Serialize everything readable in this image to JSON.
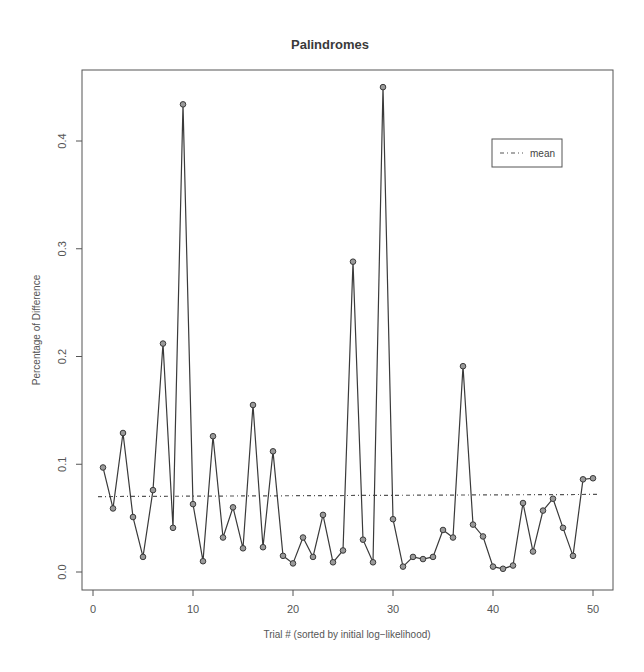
{
  "chart_data": {
    "type": "line",
    "title": "Palindromes",
    "xlabel": "Trial # (sorted by initial log−likelihood)",
    "ylabel": "Percentage of Difference",
    "xlim": [
      0,
      52
    ],
    "ylim": [
      -0.017,
      0.465
    ],
    "x_ticks": [
      0,
      10,
      20,
      30,
      40,
      50
    ],
    "y_ticks": [
      0.0,
      0.1,
      0.2,
      0.3,
      0.4
    ],
    "y_tick_labels": [
      "0.0",
      "0.1",
      "0.2",
      "0.3",
      "0.4"
    ],
    "grid": false,
    "legend_position": "top-right",
    "legend": [
      {
        "label": "mean",
        "style": "dot-dash"
      }
    ],
    "x": [
      1,
      2,
      3,
      4,
      5,
      6,
      7,
      8,
      9,
      10,
      11,
      12,
      13,
      14,
      15,
      16,
      17,
      18,
      19,
      20,
      21,
      22,
      23,
      24,
      25,
      26,
      27,
      28,
      29,
      30,
      31,
      32,
      33,
      34,
      35,
      36,
      37,
      38,
      39,
      40,
      41,
      42,
      43,
      44,
      45,
      46,
      47,
      48,
      49,
      50
    ],
    "series": [
      {
        "name": "Percentage of Difference",
        "style": "line with open circle markers",
        "values": [
          0.097,
          0.059,
          0.129,
          0.051,
          0.014,
          0.076,
          0.212,
          0.041,
          0.434,
          0.063,
          0.01,
          0.126,
          0.032,
          0.06,
          0.022,
          0.155,
          0.023,
          0.112,
          0.015,
          0.008,
          0.032,
          0.014,
          0.053,
          0.009,
          0.02,
          0.288,
          0.03,
          0.009,
          0.45,
          0.049,
          0.005,
          0.014,
          0.012,
          0.014,
          0.039,
          0.032,
          0.191,
          0.044,
          0.033,
          0.005,
          0.003,
          0.006,
          0.064,
          0.019,
          0.057,
          0.068,
          0.041,
          0.015,
          0.086,
          0.087
        ]
      },
      {
        "name": "mean",
        "style": "dot-dash line",
        "x": [
          0.5,
          50.5
        ],
        "values": [
          0.07,
          0.072
        ]
      }
    ]
  },
  "colors": {
    "line": "#3a3a3a",
    "marker_fill": "#9a9a9a",
    "axis": "#555555",
    "mean_line": "#555555"
  }
}
